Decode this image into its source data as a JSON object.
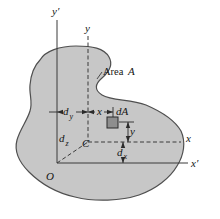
{
  "figure": {
    "labels": {
      "y_prime_axis": "y′",
      "y_centroidal_axis": "y",
      "area_word": "Area",
      "area_symbol": "A",
      "d_y": {
        "base": "d",
        "sub": "y"
      },
      "x_offset": "x",
      "dA_element": "dA",
      "y_offset": "y",
      "x_centroidal_axis": "x",
      "centroid": "C",
      "d_z": {
        "base": "d",
        "sub": "z"
      },
      "d_x": {
        "base": "d",
        "sub": "x"
      },
      "origin": "O",
      "x_prime_axis": "x′"
    },
    "colors": {
      "area_fill": "#c7c7c7",
      "area_stroke": "#4f4f4f",
      "element_fill": "#8e8e8e",
      "line": "#3a3a3a",
      "text": "#141414",
      "background": "#ffffff"
    }
  }
}
